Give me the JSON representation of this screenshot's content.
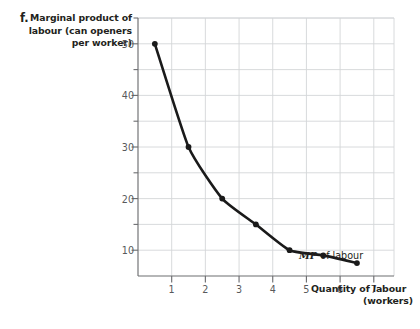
{
  "figure": {
    "part_letter": "f.",
    "y_axis_title_lines": [
      "Marginal product of",
      "labour (can openers",
      "per worker)"
    ],
    "x_axis_title_line1": "Quantity of labour",
    "x_axis_title_line2": "(workers)",
    "series_label_italic": "MP",
    "series_label_rest": " of labour"
  },
  "chart_data": {
    "type": "line",
    "title": "",
    "xlabel": "Quantity of labour (workers)",
    "ylabel": "Marginal product of labour (can openers per worker)",
    "x": [
      0.5,
      1.5,
      2.5,
      3.5,
      4.5,
      5.5,
      6.5
    ],
    "values": [
      50,
      30,
      20,
      15,
      10,
      9,
      7.5
    ],
    "series": [
      {
        "name": "MP of labour",
        "x": [
          0.5,
          1.5,
          2.5,
          3.5,
          4.5,
          5.5,
          6.5
        ],
        "values": [
          50,
          30,
          20,
          15,
          10,
          9,
          7.5
        ]
      }
    ],
    "xlim": [
      0,
      7.6
    ],
    "ylim": [
      5,
      55
    ],
    "x_ticks": [
      1,
      2,
      3,
      4,
      5,
      6,
      7
    ],
    "x_tick_labels": [
      "1",
      "2",
      "3",
      "4",
      "5",
      "6",
      "7"
    ],
    "y_ticks_major": [
      10,
      20,
      30,
      40,
      50
    ],
    "y_tick_labels": [
      "10",
      "20",
      "30",
      "40",
      "50"
    ],
    "y_ticks_minor": [
      15,
      25,
      35,
      45,
      55
    ],
    "grid": true,
    "grid_x_values": [
      1,
      2,
      3,
      4,
      5,
      6,
      7
    ],
    "grid_y_values": [
      10,
      15,
      20,
      25,
      30,
      35,
      40,
      45,
      50,
      55
    ],
    "legend_position": "inline-right",
    "annotations": [
      "MP of labour"
    ],
    "marker": "filled-circle",
    "line_color": "#1a1a1a",
    "grid_color": "#d4d6d8",
    "axis_color": "#6d6e71"
  },
  "colors": {
    "background": "#ffffff",
    "ink": "#231f20",
    "tick_label": "#58595b",
    "grid": "#d4d6d8",
    "axis": "#6d6e71",
    "curve": "#1a1a1a"
  }
}
